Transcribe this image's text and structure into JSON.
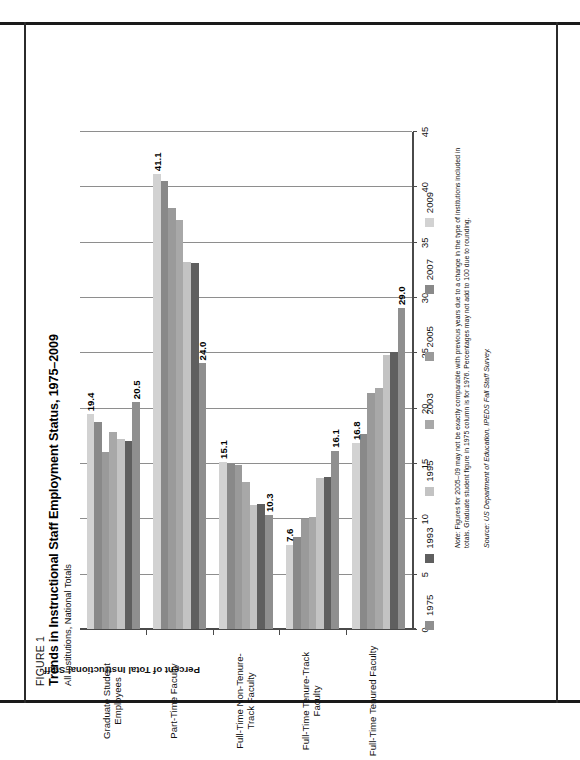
{
  "figure": {
    "number": "FIGURE 1",
    "title": "Trends in Instructional Staff Employment Status, 1975–2009",
    "subtitle": "All Institutions, National Totals"
  },
  "note": {
    "prefix": "Note:",
    "text": " Figures for 2005–09 may not be exactly comparable with previous years due to a change in the type of institutions included in totals. Graduate student figure in 1975 column is for 1976. Percentages may not add to 100 due to rounding."
  },
  "source": "Source: US Department of Education, IPEDS Fall Staff Survey.",
  "chart_data": {
    "type": "bar",
    "orientation": "horizontal",
    "title": "Trends in Instructional Staff Employment Status, 1975–2009",
    "subtitle": "All Institutions, National Totals",
    "xlabel": "",
    "ylabel": "Percent of Total Instructional Staff",
    "xlim": [
      0,
      45
    ],
    "xticks": [
      0,
      5,
      10,
      15,
      20,
      25,
      30,
      35,
      40,
      45
    ],
    "grid": true,
    "legend_position": "bottom",
    "categories": [
      "Full-Time Tenured Faculty",
      "Full-Time Tenure-Track Faculty",
      "Full-Time Non-Tenure-Track Faculty",
      "Part-Time Faculty",
      "Graduate Student Employees"
    ],
    "series": [
      {
        "name": "1975",
        "color": "#8f8f8f",
        "values": [
          29.0,
          16.1,
          10.3,
          24.0,
          20.5
        ]
      },
      {
        "name": "1993",
        "color": "#5f5f5f",
        "values": [
          25.0,
          13.7,
          11.3,
          33.1,
          17.0
        ]
      },
      {
        "name": "1995",
        "color": "#c3c3c3",
        "values": [
          24.8,
          13.6,
          11.2,
          33.2,
          17.2
        ]
      },
      {
        "name": "2003",
        "color": "#a8a8a8",
        "values": [
          21.8,
          10.1,
          13.3,
          37.0,
          17.8
        ]
      },
      {
        "name": "2005",
        "color": "#9a9a9a",
        "values": [
          21.3,
          9.9,
          14.8,
          38.0,
          16.0
        ]
      },
      {
        "name": "2007",
        "color": "#898989",
        "values": [
          17.6,
          8.3,
          14.9,
          40.5,
          18.7
        ]
      },
      {
        "name": "2009",
        "color": "#d2d2d2",
        "values": [
          16.8,
          7.6,
          15.1,
          41.1,
          19.4
        ]
      }
    ],
    "value_labels": [
      {
        "category": "Full-Time Tenured Faculty",
        "series": "1975",
        "text": "29.0"
      },
      {
        "category": "Full-Time Tenured Faculty",
        "series": "2009",
        "text": "16.8"
      },
      {
        "category": "Full-Time Tenure-Track Faculty",
        "series": "1975",
        "text": "16.1"
      },
      {
        "category": "Full-Time Tenure-Track Faculty",
        "series": "2009",
        "text": "7.6"
      },
      {
        "category": "Full-Time Non-Tenure-Track Faculty",
        "series": "1975",
        "text": "10.3"
      },
      {
        "category": "Full-Time Non-Tenure-Track Faculty",
        "series": "2009",
        "text": "15.1"
      },
      {
        "category": "Part-Time Faculty",
        "series": "1975",
        "text": "24.0"
      },
      {
        "category": "Part-Time Faculty",
        "series": "2009",
        "text": "41.1"
      },
      {
        "category": "Graduate Student Employees",
        "series": "1975",
        "text": "20.5"
      },
      {
        "category": "Graduate Student Employees",
        "series": "2009",
        "text": "19.4"
      }
    ]
  }
}
